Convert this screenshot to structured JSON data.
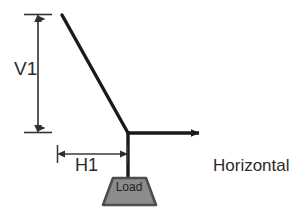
{
  "diagram": {
    "type": "free-body-force-diagram",
    "background_color": "#ffffff",
    "line_color": "#1a1a1a",
    "dimension_color": "#3a3a3a",
    "text_color": "#2b2b2b",
    "load_fill_color": "#8c8c8c",
    "load_stroke_color": "#4d4d4d",
    "labels": {
      "vertical_dimension": "V1",
      "horizontal_dimension": "H1",
      "force_line1": "Horizontal",
      "force_line2": "Force",
      "load": "Load"
    },
    "members": {
      "diagonal": {
        "x1": 62,
        "y1": 15,
        "x2": 128,
        "y2": 133
      },
      "horizontal_arrow": {
        "x1": 128,
        "y1": 133,
        "x2": 207,
        "y2": 133
      },
      "vertical_post": {
        "x1": 128,
        "y1": 133,
        "x2": 128,
        "y2": 178
      }
    },
    "dimensions": {
      "v1": {
        "x": 38,
        "y_top": 14,
        "y_bottom": 133,
        "tick_half_width": 14
      },
      "h1": {
        "y": 154,
        "x_left": 57,
        "x_right": 128,
        "tick_half_height": 9
      }
    },
    "load_shape": {
      "top_left_x": 113,
      "top_right_x": 146,
      "bottom_left_x": 103,
      "bottom_right_x": 156,
      "top_y": 178,
      "bottom_y": 205
    }
  }
}
